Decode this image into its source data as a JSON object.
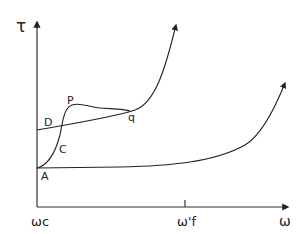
{
  "diagram": {
    "y_axis_label": "τ",
    "x_axis_label": "ω",
    "x_ticks": [
      {
        "label": "ωc",
        "position": "origin"
      },
      {
        "label": "ω'f",
        "position": "mid"
      }
    ],
    "point_labels": {
      "A": "A",
      "C": "C",
      "D": "D",
      "P": "P",
      "q": "q"
    },
    "curves": [
      {
        "name": "lower-curve",
        "from": "A",
        "description": "Nearly flat from A, rising steeply near ω'f and beyond"
      },
      {
        "name": "upper-curve",
        "from": "D",
        "description": "Gently rising from D through q, then steeply upward"
      },
      {
        "name": "transition-curve",
        "from": "A",
        "through": [
          "C",
          "P"
        ],
        "to": "q",
        "description": "Rises steeply from A through C to peak P, then levels off and merges at q"
      }
    ],
    "colors": {
      "line": "#222222",
      "background": "#ffffff"
    }
  }
}
